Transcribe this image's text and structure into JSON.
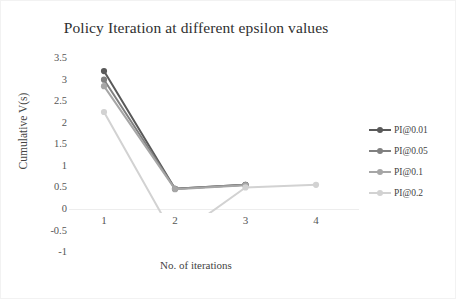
{
  "chart_data": {
    "type": "line",
    "title": "Policy Iteration at different epsilon values",
    "xlabel": "No. of iterations",
    "ylabel": "Cumulative V(s)",
    "x": [
      1,
      2,
      3,
      4
    ],
    "categories": [
      "1",
      "2",
      "3",
      "4"
    ],
    "xticklabels": [
      "1",
      "2",
      "3",
      "4"
    ],
    "yticklabels": [
      "3.5",
      "3",
      "2.5",
      "2",
      "1.5",
      "1",
      "0.5",
      "0",
      "-0.5",
      "-1"
    ],
    "yticks": [
      3.5,
      3,
      2.5,
      2,
      1.5,
      1,
      0.5,
      0,
      -0.5,
      -1
    ],
    "ylim": [
      -1,
      3.5
    ],
    "xlim": [
      0.6,
      4.4
    ],
    "grid": false,
    "legend_position": "right",
    "series": [
      {
        "name": "PI@0.01",
        "color": "#595959",
        "x": [
          1,
          2,
          3
        ],
        "values": [
          3.2,
          0.47,
          0.56
        ]
      },
      {
        "name": "PI@0.05",
        "color": "#808080",
        "x": [
          1,
          2,
          3
        ],
        "values": [
          3.0,
          0.47,
          0.56
        ]
      },
      {
        "name": "PI@0.1",
        "color": "#a6a6a6",
        "x": [
          1,
          2,
          3
        ],
        "values": [
          2.85,
          0.46,
          0.55
        ]
      },
      {
        "name": "PI@0.2",
        "color": "#d2d2d2",
        "x": [
          1,
          2,
          3,
          4
        ],
        "values": [
          2.25,
          -0.67,
          0.5,
          0.56
        ]
      }
    ]
  },
  "legend": {
    "items": [
      {
        "label": "PI@0.01"
      },
      {
        "label": "PI@0.05"
      },
      {
        "label": "PI@0.1"
      },
      {
        "label": "PI@0.2"
      }
    ]
  }
}
